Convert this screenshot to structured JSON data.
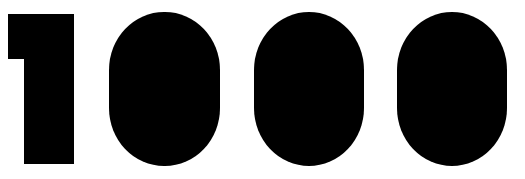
{
  "graphic": {
    "text": "1000",
    "digits": [
      "1",
      "0",
      "0",
      "0"
    ],
    "color": "#000000",
    "background": "#ffffff"
  }
}
